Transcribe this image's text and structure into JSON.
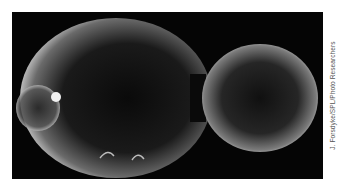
{
  "figure": {
    "credit": "J. Forsdyke/SPL/Photo Researchers",
    "colors": {
      "background": "#050505",
      "cell_highlight": "#f2f2f2",
      "cell_interior": "#111111",
      "page": "#ffffff"
    }
  }
}
